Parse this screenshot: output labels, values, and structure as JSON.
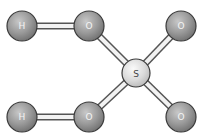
{
  "diagram": {
    "type": "ball-and-stick molecule",
    "molecule": "sulfuric acid",
    "atoms": [
      {
        "id": "h1",
        "label": "H",
        "x": 22,
        "y": 26,
        "r": 15,
        "color": "#8f8f8f"
      },
      {
        "id": "o1",
        "label": "O",
        "x": 89,
        "y": 26,
        "r": 15,
        "color": "#8f8f8f"
      },
      {
        "id": "o3",
        "label": "O",
        "x": 181,
        "y": 26,
        "r": 15,
        "color": "#8f8f8f"
      },
      {
        "id": "s",
        "label": "S",
        "x": 136,
        "y": 73,
        "r": 14,
        "color": "#d9d9d9"
      },
      {
        "id": "h2",
        "label": "H",
        "x": 22,
        "y": 117,
        "r": 15,
        "color": "#8f8f8f"
      },
      {
        "id": "o2",
        "label": "O",
        "x": 89,
        "y": 117,
        "r": 15,
        "color": "#8f8f8f"
      },
      {
        "id": "o4",
        "label": "O",
        "x": 181,
        "y": 117,
        "r": 15,
        "color": "#8f8f8f"
      }
    ],
    "bonds": [
      {
        "from": "h1",
        "to": "o1"
      },
      {
        "from": "h2",
        "to": "o2"
      },
      {
        "from": "o1",
        "to": "s"
      },
      {
        "from": "o2",
        "to": "s"
      },
      {
        "from": "o3",
        "to": "s"
      },
      {
        "from": "o4",
        "to": "s"
      }
    ],
    "labels": {
      "h1": "H",
      "o1": "O",
      "o3": "O",
      "s": "S",
      "h2": "H",
      "o2": "O",
      "o4": "O"
    }
  }
}
